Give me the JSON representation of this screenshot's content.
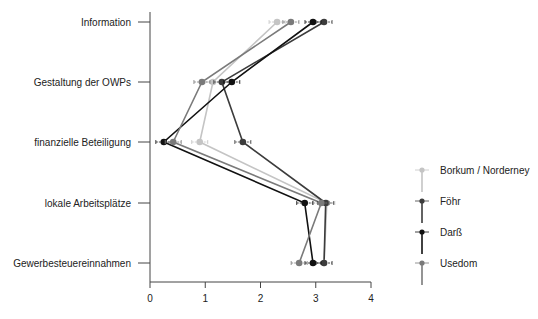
{
  "chart_data": {
    "type": "line",
    "orientation": "horizontal",
    "title": "",
    "xlabel": "",
    "ylabel": "",
    "xlim": [
      0,
      4
    ],
    "xticks": [
      "0",
      "1",
      "2",
      "3",
      "4"
    ],
    "categories": [
      "Information",
      "Gestaltung der OWPs",
      "finanzielle Beteiligung",
      "lokale Arbeitsplätze",
      "Gewerbesteuereinnahmen"
    ],
    "series": [
      {
        "name": "Borkum / Norderney",
        "color": "#c4c4c4",
        "values": [
          2.3,
          1.14,
          0.9,
          3.2,
          3.15
        ]
      },
      {
        "name": "Föhr",
        "color": "#3c3c3c",
        "values": [
          3.15,
          1.3,
          1.68,
          3.18,
          3.15
        ]
      },
      {
        "name": "Darß",
        "color": "#111111",
        "values": [
          2.95,
          1.48,
          0.25,
          2.8,
          2.95
        ]
      },
      {
        "name": "Usedom",
        "color": "#7a7a7a",
        "values": [
          2.55,
          0.94,
          0.42,
          3.1,
          2.7
        ]
      }
    ],
    "error_bars": true,
    "grid": false,
    "legend_position": "right"
  }
}
